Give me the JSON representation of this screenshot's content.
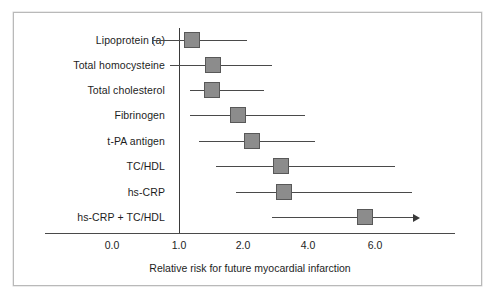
{
  "figure": {
    "xlabel": "Relative risk for future myocardial infarction",
    "reference_line_value": "1.0",
    "marker_color": "#8c8c8c",
    "marker_border_color": "#585858",
    "line_color": "#4a4a4a",
    "frame_color": "#b9b9b9"
  },
  "chart_data": {
    "type": "bar",
    "subtype": "forest-plot",
    "title": "",
    "xlabel": "Relative risk for future myocardial infarction",
    "ylabel": "",
    "grid": false,
    "legend": "none",
    "reference_line": 1.0,
    "x_ticks": [
      {
        "label": "0.0",
        "value": 0.0,
        "px": 112
      },
      {
        "label": "1.0",
        "value": 1.0,
        "px": 179
      },
      {
        "label": "2.0",
        "value": 2.0,
        "px": 243
      },
      {
        "label": "4.0",
        "value": 4.0,
        "px": 308
      },
      {
        "label": "6.0",
        "value": 6.0,
        "px": 375
      }
    ],
    "axis_note": "non-linear x axis: linear 0.0-2.0, compressed 2.0-6.0",
    "categories": [
      "Lipoprotein (a)",
      "Total homocysteine",
      "Total cholesterol",
      "Fibrinogen",
      "t-PA antigen",
      "TC/HDL",
      "hs-CRP",
      "hs-CRP + TC/HDL"
    ],
    "values": [
      1.2,
      1.5,
      1.5,
      1.9,
      2.2,
      3.1,
      3.2,
      5.8
    ],
    "ci_low": [
      0.65,
      0.85,
      1.2,
      1.2,
      1.3,
      1.55,
      1.9,
      3.5
    ],
    "ci_high": [
      2.05,
      2.4,
      2.3,
      2.9,
      3.2,
      5.4,
      6.1,
      7.0
    ],
    "ci_high_open": [
      false,
      false,
      false,
      false,
      false,
      false,
      false,
      true
    ],
    "series": [
      {
        "name": "Relative risk",
        "points": [
          {
            "category": "Lipoprotein (a)",
            "value": 1.2,
            "ci_low": 0.65,
            "ci_high": 2.05,
            "open_right": false
          },
          {
            "category": "Total homocysteine",
            "value": 1.5,
            "ci_low": 0.85,
            "ci_high": 2.4,
            "open_right": false
          },
          {
            "category": "Total cholesterol",
            "value": 1.5,
            "ci_low": 1.2,
            "ci_high": 2.3,
            "open_right": false
          },
          {
            "category": "Fibrinogen",
            "value": 1.9,
            "ci_low": 1.2,
            "ci_high": 2.9,
            "open_right": false
          },
          {
            "category": "t-PA antigen",
            "value": 2.2,
            "ci_low": 1.3,
            "ci_high": 3.2,
            "open_right": false
          },
          {
            "category": "TC/HDL",
            "value": 3.1,
            "ci_low": 1.55,
            "ci_high": 5.4,
            "open_right": false
          },
          {
            "category": "hs-CRP",
            "value": 3.2,
            "ci_low": 1.9,
            "ci_high": 6.1,
            "open_right": false
          },
          {
            "category": "hs-CRP + TC/HDL",
            "value": 5.8,
            "ci_low": 3.5,
            "ci_high": 7.0,
            "open_right": true
          }
        ]
      }
    ]
  },
  "geometry": {
    "rows": [
      {
        "y": 40,
        "marker_px": 192,
        "low_px": 152,
        "high_px": 247,
        "cap_low": true,
        "cap_high": false,
        "arrow": false
      },
      {
        "y": 65,
        "marker_px": 213,
        "low_px": 170,
        "high_px": 272,
        "cap_low": false,
        "cap_high": false,
        "arrow": false
      },
      {
        "y": 90,
        "marker_px": 212,
        "low_px": 190,
        "high_px": 264,
        "cap_low": false,
        "cap_high": false,
        "arrow": false
      },
      {
        "y": 115,
        "marker_px": 238,
        "low_px": 190,
        "high_px": 305,
        "cap_low": false,
        "cap_high": false,
        "arrow": false
      },
      {
        "y": 141,
        "marker_px": 252,
        "low_px": 199,
        "high_px": 315,
        "cap_low": false,
        "cap_high": false,
        "arrow": false
      },
      {
        "y": 166,
        "marker_px": 281,
        "low_px": 216,
        "high_px": 395,
        "cap_low": false,
        "cap_high": false,
        "arrow": false
      },
      {
        "y": 192,
        "marker_px": 284,
        "low_px": 236,
        "high_px": 412,
        "cap_low": false,
        "cap_high": false,
        "arrow": false
      },
      {
        "y": 217,
        "marker_px": 365,
        "low_px": 272,
        "high_px": 413,
        "cap_low": false,
        "cap_high": false,
        "arrow": true
      }
    ],
    "label_right_edge": 165,
    "axis_y": 233,
    "axis_left": 45,
    "axis_right": 455,
    "vline_x": 179,
    "vline_top": 28,
    "vline_bottom": 233,
    "tick_label_y": 239,
    "xlabel_y": 262,
    "marker_size": 16
  }
}
